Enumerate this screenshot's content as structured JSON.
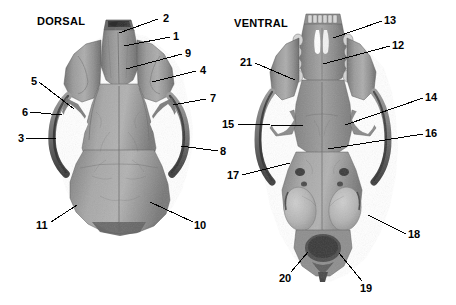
{
  "figure": {
    "width": 456,
    "height": 305,
    "background_color": "#ffffff",
    "ink_color": "#000000"
  },
  "views": [
    {
      "id": "dorsal",
      "title": "DORSAL",
      "title_x": 37,
      "title_y": 15
    },
    {
      "id": "ventral",
      "title": "VENTRAL",
      "title_x": 234,
      "title_y": 17
    }
  ],
  "callouts": [
    {
      "id": "c2",
      "label": "2",
      "view": "dorsal",
      "text_x": 163,
      "text_y": 13,
      "line": [
        158,
        19,
        119,
        33
      ]
    },
    {
      "id": "c1",
      "label": "1",
      "view": "dorsal",
      "text_x": 173,
      "text_y": 31,
      "line": [
        170,
        37,
        124,
        46
      ]
    },
    {
      "id": "c9",
      "label": "9",
      "view": "dorsal",
      "text_x": 185,
      "text_y": 48,
      "line": [
        182,
        54,
        126,
        69
      ]
    },
    {
      "id": "c4",
      "label": "4",
      "view": "dorsal",
      "text_x": 200,
      "text_y": 65,
      "line": [
        196,
        71,
        152,
        82
      ]
    },
    {
      "id": "c5",
      "label": "5",
      "view": "dorsal",
      "text_x": 31,
      "text_y": 76,
      "line": [
        39,
        82,
        74,
        109
      ]
    },
    {
      "id": "c7",
      "label": "7",
      "view": "dorsal",
      "text_x": 210,
      "text_y": 93,
      "line": [
        206,
        99,
        173,
        105
      ]
    },
    {
      "id": "c6",
      "label": "6",
      "view": "dorsal",
      "text_x": 22,
      "text_y": 107,
      "line": [
        30,
        112,
        62,
        115
      ]
    },
    {
      "id": "c3",
      "label": "3",
      "view": "dorsal",
      "text_x": 18,
      "text_y": 133,
      "line": [
        26,
        138,
        56,
        138
      ]
    },
    {
      "id": "c8",
      "label": "8",
      "view": "dorsal",
      "text_x": 220,
      "text_y": 146,
      "line": [
        218,
        151,
        181,
        146
      ]
    },
    {
      "id": "c11",
      "label": "11",
      "view": "dorsal",
      "text_x": 36,
      "text_y": 220,
      "line": [
        51,
        222,
        77,
        205
      ]
    },
    {
      "id": "c10",
      "label": "10",
      "view": "dorsal",
      "text_x": 194,
      "text_y": 220,
      "line": [
        193,
        222,
        150,
        202
      ]
    },
    {
      "id": "c13",
      "label": "13",
      "view": "ventral",
      "text_x": 384,
      "text_y": 15,
      "line": [
        382,
        21,
        333,
        38
      ]
    },
    {
      "id": "c12",
      "label": "12",
      "view": "ventral",
      "text_x": 392,
      "text_y": 40,
      "line": [
        390,
        46,
        323,
        64
      ]
    },
    {
      "id": "c21",
      "label": "21",
      "view": "ventral",
      "text_x": 240,
      "text_y": 57,
      "line": [
        255,
        63,
        295,
        80
      ]
    },
    {
      "id": "c14",
      "label": "14",
      "view": "ventral",
      "text_x": 425,
      "text_y": 92,
      "line": [
        423,
        98,
        345,
        125
      ]
    },
    {
      "id": "c15",
      "label": "15",
      "view": "ventral",
      "text_x": 222,
      "text_y": 119,
      "line": [
        237,
        124,
        303,
        126
      ]
    },
    {
      "id": "c16",
      "label": "16",
      "view": "ventral",
      "text_x": 425,
      "text_y": 128,
      "line": [
        423,
        134,
        328,
        149
      ]
    },
    {
      "id": "c17",
      "label": "17",
      "view": "ventral",
      "text_x": 227,
      "text_y": 170,
      "line": [
        242,
        175,
        290,
        163
      ]
    },
    {
      "id": "c18",
      "label": "18",
      "view": "ventral",
      "text_x": 408,
      "text_y": 229,
      "line": [
        406,
        234,
        368,
        215
      ]
    },
    {
      "id": "c20",
      "label": "20",
      "view": "ventral",
      "text_x": 279,
      "text_y": 273,
      "line": [
        291,
        272,
        308,
        252
      ]
    },
    {
      "id": "c19",
      "label": "19",
      "view": "ventral",
      "text_x": 360,
      "text_y": 283,
      "line": [
        362,
        281,
        339,
        253
      ]
    }
  ]
}
